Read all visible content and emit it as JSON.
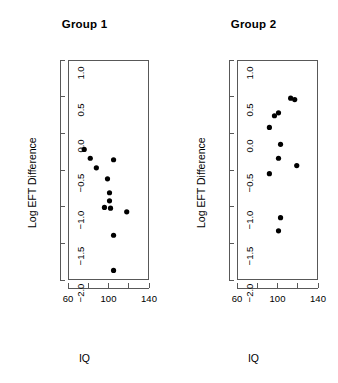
{
  "figure": {
    "background": "#ffffff",
    "foreground": "#000000",
    "axis_color": "#585858",
    "point_color": "#000000"
  },
  "chart_data": [
    {
      "type": "scatter",
      "title": "Group 1",
      "xlabel": "IQ",
      "ylabel": "Log EFT Difference",
      "xlim": [
        60,
        140
      ],
      "ylim": [
        -2.0,
        1.0
      ],
      "xticks": [
        60,
        80,
        100,
        120,
        140
      ],
      "xtick_labels": [
        "60",
        "",
        "100",
        "",
        "140"
      ],
      "yticks": [
        1.0,
        0.5,
        0.0,
        -0.5,
        -1.0,
        -1.5,
        -2.0
      ],
      "ytick_labels": [
        "1.0",
        "0.5",
        "0.0",
        "-0.5",
        "-1.0",
        "-1.5",
        "-2.0"
      ],
      "grid": false,
      "legend": null,
      "x": [
        76,
        82,
        88,
        99,
        101,
        101,
        102,
        105,
        105,
        107,
        118
      ],
      "y": [
        -0.22,
        -0.34,
        -0.47,
        -0.62,
        -0.81,
        -0.92,
        -1.02,
        -0.36,
        -1.01,
        -1.39,
        -1.07
      ],
      "points": [
        {
          "x": 76,
          "y": -0.22
        },
        {
          "x": 82,
          "y": -0.34
        },
        {
          "x": 88,
          "y": -0.47
        },
        {
          "x": 99,
          "y": -0.62
        },
        {
          "x": 101,
          "y": -0.81
        },
        {
          "x": 101,
          "y": -0.92
        },
        {
          "x": 102,
          "y": -1.02
        },
        {
          "x": 105,
          "y": -0.36
        },
        {
          "x": 96,
          "y": -1.01
        },
        {
          "x": 105,
          "y": -1.39
        },
        {
          "x": 118,
          "y": -1.07
        },
        {
          "x": 105,
          "y": -1.87
        }
      ]
    },
    {
      "type": "scatter",
      "title": "Group 2",
      "xlabel": "IQ",
      "ylabel": "Log EFT Difference",
      "xlim": [
        60,
        140
      ],
      "ylim": [
        -2.0,
        1.0
      ],
      "xticks": [
        60,
        80,
        100,
        120,
        140
      ],
      "xtick_labels": [
        "60",
        "",
        "100",
        "",
        "140"
      ],
      "yticks": [
        1.0,
        0.5,
        0.0,
        -0.5,
        -1.0,
        -1.5,
        -2.0
      ],
      "ytick_labels": [
        "1.0",
        "0.5",
        "0.0",
        "-0.5",
        "-1.0",
        "-1.5",
        "-2.0"
      ],
      "grid": false,
      "legend": null,
      "x": [
        92,
        92,
        97,
        101,
        101,
        103,
        103,
        113,
        117,
        119,
        101,
        103
      ],
      "y": [
        0.08,
        -0.55,
        0.24,
        0.28,
        -0.34,
        -0.15,
        -1.33,
        0.48,
        0.46,
        -0.44,
        -1.15,
        -1.33
      ],
      "points": [
        {
          "x": 92,
          "y": 0.08
        },
        {
          "x": 92,
          "y": -0.55
        },
        {
          "x": 97,
          "y": 0.24
        },
        {
          "x": 101,
          "y": 0.28
        },
        {
          "x": 101,
          "y": -0.34
        },
        {
          "x": 103,
          "y": -0.15
        },
        {
          "x": 113,
          "y": 0.48
        },
        {
          "x": 117,
          "y": 0.46
        },
        {
          "x": 119,
          "y": -0.44
        },
        {
          "x": 103,
          "y": -1.15
        },
        {
          "x": 101,
          "y": -1.33
        }
      ]
    }
  ]
}
